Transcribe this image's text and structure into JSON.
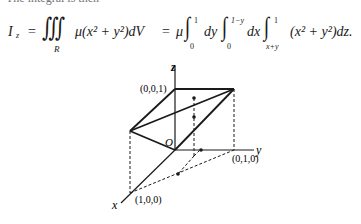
{
  "top_fragment": "The integral is then",
  "equation": {
    "lhs": "I",
    "lhs_sub": "z",
    "eq1": "=",
    "triple_integral": "∭",
    "region": "R",
    "integrand1": "μ(x² + y²)dV",
    "eq2": "=",
    "mu": "μ",
    "int1": {
      "symbol": "∫",
      "lower": "0",
      "upper": "1",
      "diff": "dy"
    },
    "int2": {
      "symbol": "∫",
      "lower": "0",
      "upper": "1−y",
      "diff": "dx"
    },
    "int3": {
      "symbol": "∫",
      "lower": "x+y",
      "upper": "1"
    },
    "integrand2": "(x² + y²)dz."
  },
  "figure": {
    "axis_labels": {
      "x": "x",
      "y": "y",
      "z": "z"
    },
    "origin_label": "O",
    "point_labels": {
      "z_unit": "(0,0,1)",
      "y_unit": "(0,1,0)",
      "x_unit": "(1,0,0)"
    }
  }
}
